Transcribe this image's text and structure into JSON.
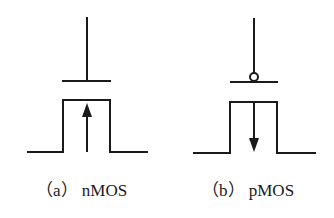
{
  "figure": {
    "panels": [
      {
        "id": "a",
        "caption": "（a） nMOS",
        "device": "nMOS",
        "gate_bubble": false,
        "arrow_direction": "up"
      },
      {
        "id": "b",
        "caption": "（b） pMOS",
        "device": "pMOS",
        "gate_bubble": true,
        "arrow_direction": "down"
      }
    ],
    "colors": {
      "stroke": "#1a1a1a",
      "background": "#ffffff"
    }
  }
}
